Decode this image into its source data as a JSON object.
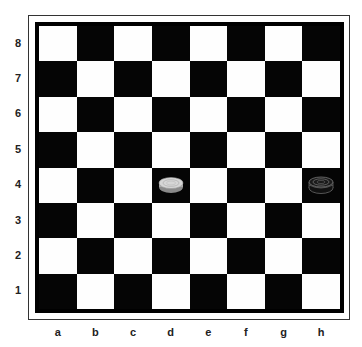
{
  "board": {
    "ranks": [
      "8",
      "7",
      "6",
      "5",
      "4",
      "3",
      "2",
      "1"
    ],
    "files": [
      "a",
      "b",
      "c",
      "d",
      "e",
      "f",
      "g",
      "h"
    ],
    "light_color": "#fefefe",
    "dark_color": "#050505",
    "pieces": [
      {
        "square": "d4",
        "color": "white",
        "type": "man"
      },
      {
        "square": "h4",
        "color": "black",
        "type": "king"
      }
    ]
  }
}
